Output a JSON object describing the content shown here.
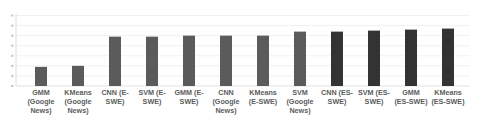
{
  "chart_data": {
    "type": "bar",
    "title": "",
    "xlabel": "",
    "ylabel": "",
    "ylim": [
      0,
      0.7
    ],
    "y_ticks": [
      0,
      0.1,
      0.2,
      0.3,
      0.4,
      0.5,
      0.6,
      0.7
    ],
    "y_tick_labels_legible": false,
    "grid": true,
    "legend": null,
    "categories": [
      "GMM (Google News)",
      "KMeans (Google News)",
      "CNN (E-SWE)",
      "SVM (E-SWE)",
      "GMM (E-SWE)",
      "CNN (Google News)",
      "KMeans (E-SWE)",
      "SVM (Google News)",
      "CNN (ES-SWE)",
      "SVM (ES-SWE)",
      "GMM (ES-SWE)",
      "KMeans (ES-SWE)"
    ],
    "category_label_lines": [
      [
        "GMM",
        "(Google",
        "News)"
      ],
      [
        "KMeans",
        "(Google",
        "News)"
      ],
      [
        "CNN (E-",
        "SWE)"
      ],
      [
        "SVM (E-",
        "SWE)"
      ],
      [
        "GMM (E-",
        "SWE)"
      ],
      [
        "CNN",
        "(Google",
        "News)"
      ],
      [
        "KMeans",
        "(E-SWE)"
      ],
      [
        "SVM",
        "(Google",
        "News)"
      ],
      [
        "CNN (ES-",
        "SWE)"
      ],
      [
        "SVM (ES-",
        "SWE)"
      ],
      [
        "GMM",
        "(ES-SWE)"
      ],
      [
        "KMeans",
        "(ES-SWE)"
      ]
    ],
    "values": [
      0.19,
      0.2,
      0.49,
      0.49,
      0.5,
      0.5,
      0.5,
      0.54,
      0.54,
      0.55,
      0.56,
      0.57
    ],
    "bar_colors": [
      "#5b5b5b",
      "#5b5b5b",
      "#5b5b5b",
      "#5b5b5b",
      "#5b5b5b",
      "#5b5b5b",
      "#5b5b5b",
      "#5b5b5b",
      "#333333",
      "#333333",
      "#333333",
      "#333333"
    ]
  },
  "colors": {
    "bar_light": "#5b5b5b",
    "bar_dark": "#333333",
    "gridline": "#ececec",
    "axis": "#d9d9d9",
    "label_text": "#5c5c5c"
  }
}
